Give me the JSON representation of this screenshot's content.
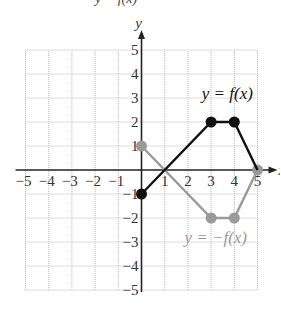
{
  "header": {
    "cutoff_text": "y = f(x)"
  },
  "chart_data": {
    "type": "line",
    "title": "",
    "xlabel": "x",
    "ylabel": "y",
    "xlim": [
      -5,
      5
    ],
    "ylim": [
      -5,
      5
    ],
    "grid": true,
    "x_ticks": [
      -5,
      -4,
      -3,
      -2,
      -1,
      1,
      2,
      3,
      4,
      5
    ],
    "y_ticks": [
      -5,
      -4,
      -3,
      -2,
      -1,
      1,
      2,
      3,
      4,
      5
    ],
    "series": [
      {
        "name": "y = f(x)",
        "color": "#111111",
        "points": [
          [
            0,
            -1
          ],
          [
            3,
            2
          ],
          [
            4,
            2
          ],
          [
            5,
            0
          ]
        ],
        "markers": [
          [
            0,
            -1
          ],
          [
            3,
            2
          ],
          [
            4,
            2
          ]
        ],
        "label_pos": [
          3.7,
          3.2
        ]
      },
      {
        "name": "y = −f(x)",
        "color": "#9a9a9a",
        "points": [
          [
            0,
            1
          ],
          [
            3,
            -2
          ],
          [
            4,
            -2
          ],
          [
            5,
            0
          ]
        ],
        "markers": [
          [
            0,
            1
          ],
          [
            3,
            -2
          ],
          [
            4,
            -2
          ],
          [
            5,
            0
          ]
        ],
        "label_pos": [
          3.2,
          -2.8
        ]
      }
    ]
  },
  "colors": {
    "axis": "#222222",
    "grid": "#bbbbbb",
    "label": "#333333"
  }
}
